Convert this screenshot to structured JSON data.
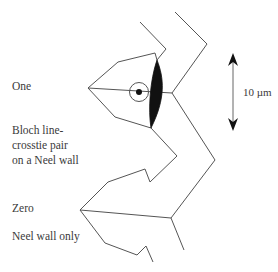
{
  "labels": {
    "one": "One",
    "bloch": "Bloch line-\ncrosstie pair\non a Neel wall",
    "zero": "Zero",
    "neel_only": "Neel wall only"
  },
  "scale_bar": {
    "label": "10 µm",
    "direction": "vertical double arrow"
  },
  "colors": {
    "line": "#555555",
    "fill": "#111111"
  },
  "elements": {
    "bloch_line_marker": "circle-with-dot",
    "crosstie_lens": "filled-black-lens"
  }
}
